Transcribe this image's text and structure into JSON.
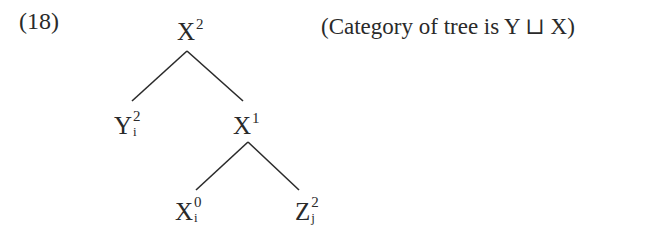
{
  "example": {
    "number": "(18)",
    "caption": "(Category of tree is Y ⊔ X)"
  },
  "tree": {
    "root": {
      "base": "X",
      "sup": "2",
      "sub": ""
    },
    "left_child": {
      "base": "Y",
      "sup": "2",
      "sub": "i"
    },
    "right_child": {
      "base": "X",
      "sup": "1",
      "sub": ""
    },
    "right_left_child": {
      "base": "X",
      "sup": "0",
      "sub": "i"
    },
    "right_right_child": {
      "base": "Z",
      "sup": "2",
      "sub": "j"
    },
    "edges": [
      [
        "root",
        "left_child"
      ],
      [
        "root",
        "right_child"
      ],
      [
        "right_child",
        "right_left_child"
      ],
      [
        "right_child",
        "right_right_child"
      ]
    ]
  }
}
